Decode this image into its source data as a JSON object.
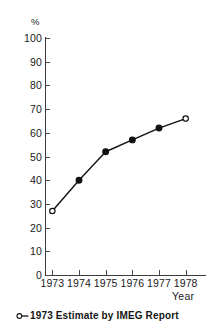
{
  "chart_data": {
    "type": "line",
    "title": "",
    "subtitle": "",
    "xlabel": "Year",
    "ylabel": "%",
    "categories": [
      "1973",
      "1974",
      "1975",
      "1976",
      "1977",
      "1978"
    ],
    "x": [
      1973,
      1974,
      1975,
      1976,
      1977,
      1978
    ],
    "values": [
      27,
      40,
      52,
      57,
      62,
      66
    ],
    "series": [
      {
        "name": "Percent",
        "values": [
          27,
          40,
          52,
          57,
          62,
          66
        ],
        "markers": [
          "open",
          "filled",
          "filled",
          "filled",
          "filled",
          "open"
        ]
      }
    ],
    "ylim": [
      0,
      100
    ],
    "ytick_labels": [
      "100",
      "90",
      "80",
      "70",
      "60",
      "50",
      "40",
      "30",
      "20",
      "10",
      "0"
    ],
    "ytick_values": [
      100,
      90,
      80,
      70,
      60,
      50,
      40,
      30,
      20,
      10,
      0
    ],
    "xtick_labels": [
      "1973",
      "1974",
      "1975",
      "1976",
      "1977",
      "1978"
    ],
    "grid": false,
    "legend_position": "below-plot",
    "annotations": [
      {
        "marker": "open-circle",
        "text": "1973 Estimate by IMEG Report"
      }
    ],
    "line_color": "#111111",
    "marker_color": "#111111",
    "axis_color": "#3b3b3b",
    "background_color": "#ffffff"
  },
  "caption": {
    "marker_icon": "open-circle-icon",
    "text": "1973 Estimate by IMEG Report"
  }
}
